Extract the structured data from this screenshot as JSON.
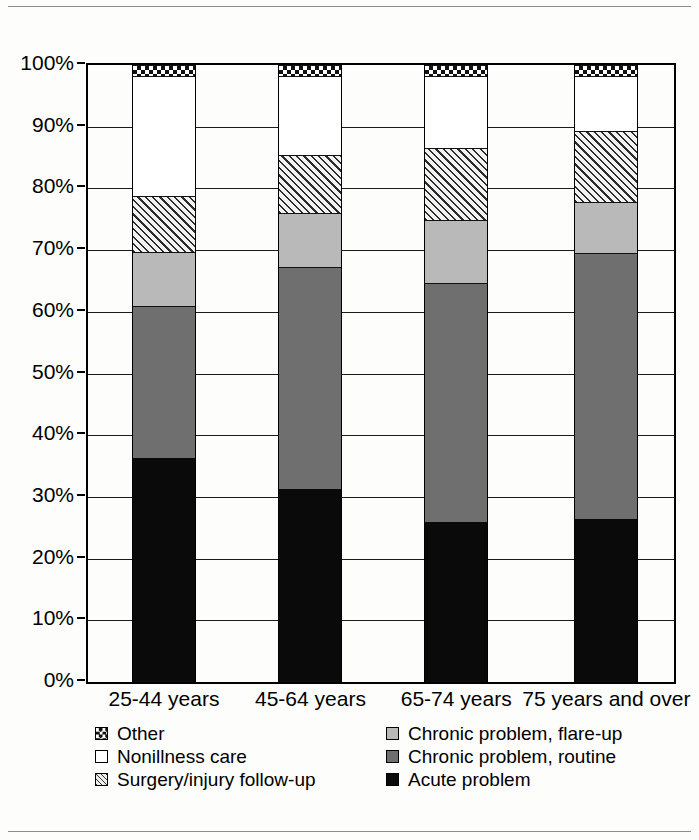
{
  "chart_data": {
    "type": "bar",
    "subtype": "stacked-bar-100-percent",
    "title": "",
    "xlabel": "",
    "ylabel": "",
    "ylim": [
      0,
      100
    ],
    "grid": true,
    "legend_position": "bottom",
    "categories": [
      "25-44 years",
      "45-64 years",
      "65-74 years",
      "75 years and over"
    ],
    "ytick_labels": [
      "0%",
      "10%",
      "20%",
      "30%",
      "40%",
      "50%",
      "60%",
      "70%",
      "80%",
      "90%",
      "100%"
    ],
    "ytick_values": [
      0,
      10,
      20,
      30,
      40,
      50,
      60,
      70,
      80,
      90,
      100
    ],
    "series": [
      {
        "name": "Acute problem",
        "values": [
          36.3,
          31.3,
          25.9,
          26.4
        ],
        "fill": "solid-black",
        "color": "#0a0a0a"
      },
      {
        "name": "Chronic problem, routine",
        "values": [
          24.7,
          36.0,
          38.8,
          43.1
        ],
        "fill": "dark-gray",
        "color": "#6f6f6f"
      },
      {
        "name": "Chronic problem, flare-up",
        "values": [
          8.7,
          8.7,
          10.2,
          8.3
        ],
        "fill": "light-gray",
        "color": "#b9b9b9"
      },
      {
        "name": "Surgery/injury follow-up",
        "values": [
          9.0,
          9.5,
          11.6,
          11.5
        ],
        "fill": "diagonal-hatch",
        "color": "#f2f2f2"
      },
      {
        "name": "Nonillness care",
        "values": [
          19.5,
          12.8,
          11.8,
          9.0
        ],
        "fill": "white",
        "color": "#ffffff"
      },
      {
        "name": "Other",
        "values": [
          1.8,
          1.7,
          1.7,
          1.7
        ],
        "fill": "checkerboard",
        "color": "#ffffff"
      }
    ]
  },
  "axis": {
    "yticks": [
      {
        "label": "100%",
        "value": 100
      },
      {
        "label": "90%",
        "value": 90
      },
      {
        "label": "80%",
        "value": 80
      },
      {
        "label": "70%",
        "value": 70
      },
      {
        "label": "60%",
        "value": 60
      },
      {
        "label": "50%",
        "value": 50
      },
      {
        "label": "40%",
        "value": 40
      },
      {
        "label": "30%",
        "value": 30
      },
      {
        "label": "20%",
        "value": 20
      },
      {
        "label": "10%",
        "value": 10
      },
      {
        "label": "0%",
        "value": 0
      }
    ],
    "categories": [
      {
        "label": "25-44 years"
      },
      {
        "label": "45-64 years"
      },
      {
        "label": "65-74 years"
      },
      {
        "label": "75 years and over"
      }
    ]
  },
  "legend": {
    "left_column": [
      {
        "label": "Other",
        "swatch": "checkerboard-swatch"
      },
      {
        "label": "Nonillness care",
        "swatch": "white-swatch"
      },
      {
        "label": "Surgery/injury follow-up",
        "swatch": "hatch-swatch"
      }
    ],
    "right_column": [
      {
        "label": "Chronic problem, flare-up",
        "swatch": "light-gray-swatch"
      },
      {
        "label": "Chronic problem, routine",
        "swatch": "dark-gray-swatch"
      },
      {
        "label": "Acute problem",
        "swatch": "black-swatch"
      }
    ]
  }
}
